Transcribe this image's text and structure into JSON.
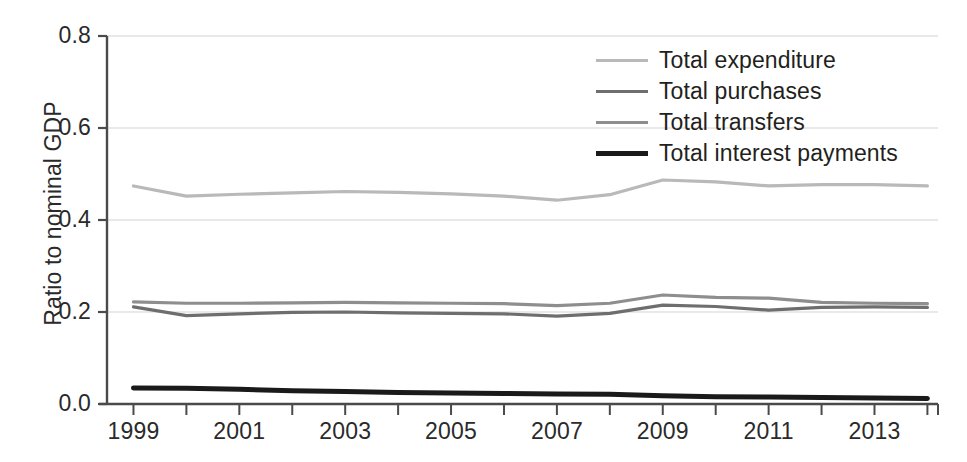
{
  "chart_data": {
    "type": "line",
    "title": "",
    "xlabel": "",
    "ylabel": "Ratio to nominal GDP",
    "xlim": [
      1998.5,
      2014.2
    ],
    "ylim": [
      0.0,
      0.8
    ],
    "grid": true,
    "grid_axis": "y",
    "legend_position": "upper right",
    "x": [
      1999,
      2000,
      2001,
      2002,
      2003,
      2004,
      2005,
      2006,
      2007,
      2008,
      2009,
      2010,
      2011,
      2012,
      2013,
      2014
    ],
    "x_tick_labels": [
      "1999",
      "2001",
      "2003",
      "2005",
      "2007",
      "2009",
      "2011",
      "2013"
    ],
    "x_tick_values": [
      1999,
      2001,
      2003,
      2005,
      2007,
      2009,
      2011,
      2013
    ],
    "x_minor_tick_values": [
      2000,
      2002,
      2004,
      2006,
      2008,
      2010,
      2012,
      2014
    ],
    "y_tick_labels": [
      "0.0",
      "0.2",
      "0.4",
      "0.6",
      "0.8"
    ],
    "y_tick_values": [
      0.0,
      0.2,
      0.4,
      0.6,
      0.8
    ],
    "series": [
      {
        "name": "Total expenditure",
        "color": "#b9b9b9",
        "width": 3.2,
        "values": [
          0.474,
          0.452,
          0.456,
          0.459,
          0.462,
          0.46,
          0.457,
          0.452,
          0.443,
          0.455,
          0.487,
          0.483,
          0.474,
          0.477,
          0.477,
          0.474
        ]
      },
      {
        "name": "Total purchases",
        "color": "#6e6e6e",
        "width": 3.2,
        "values": [
          0.211,
          0.192,
          0.196,
          0.199,
          0.2,
          0.198,
          0.197,
          0.196,
          0.191,
          0.197,
          0.215,
          0.212,
          0.204,
          0.21,
          0.211,
          0.21
        ]
      },
      {
        "name": "Total transfers",
        "color": "#8e8e8e",
        "width": 3.2,
        "values": [
          0.222,
          0.219,
          0.219,
          0.22,
          0.221,
          0.22,
          0.219,
          0.218,
          0.214,
          0.219,
          0.237,
          0.232,
          0.23,
          0.221,
          0.219,
          0.218
        ]
      },
      {
        "name": "Total interest payments",
        "color": "#1a1a1a",
        "width": 5.0,
        "values": [
          0.035,
          0.034,
          0.032,
          0.029,
          0.027,
          0.025,
          0.024,
          0.023,
          0.022,
          0.021,
          0.018,
          0.016,
          0.015,
          0.014,
          0.013,
          0.012
        ]
      }
    ]
  },
  "legend": {
    "items": [
      {
        "label": "Total expenditure",
        "color": "#b9b9b9",
        "thickness": "3px"
      },
      {
        "label": "Total purchases",
        "color": "#6e6e6e",
        "thickness": "3px"
      },
      {
        "label": "Total transfers",
        "color": "#8e8e8e",
        "thickness": "3px"
      },
      {
        "label": "Total interest payments",
        "color": "#1a1a1a",
        "thickness": "5px"
      }
    ]
  },
  "axes": {
    "y_axis_label": "Ratio to nominal GDP",
    "axis_color": "#4a4a4a",
    "grid_color": "#e2e2e2"
  }
}
